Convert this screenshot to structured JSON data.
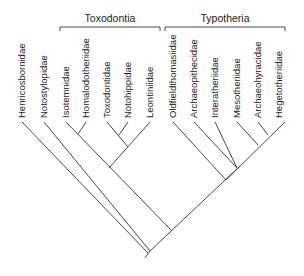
{
  "groups": [
    {
      "label": "Toxodontia",
      "x1": 60,
      "x2": 160,
      "y": 28
    },
    {
      "label": "Typotheria",
      "x1": 165,
      "x2": 285,
      "y": 28
    }
  ],
  "taxa": [
    {
      "label": "Henricosbornidae",
      "x": 22
    },
    {
      "label": "Notostylopidae",
      "x": 44
    },
    {
      "label": "Isotemnidae",
      "x": 66
    },
    {
      "label": "Homalodotheriidae",
      "x": 86
    },
    {
      "label": "Toxodontidae",
      "x": 107
    },
    {
      "label": "Notohippidae",
      "x": 128
    },
    {
      "label": "Leontiniidae",
      "x": 150
    },
    {
      "label": "Oldfieldthomasiidae",
      "x": 173
    },
    {
      "label": "Archaeopithecidae",
      "x": 194
    },
    {
      "label": "Interatheriidae",
      "x": 215
    },
    {
      "label": "Mesotheriidae",
      "x": 237
    },
    {
      "label": "Archaeohyracidae",
      "x": 258
    },
    {
      "label": "Hegetotheriidae",
      "x": 279
    }
  ]
}
